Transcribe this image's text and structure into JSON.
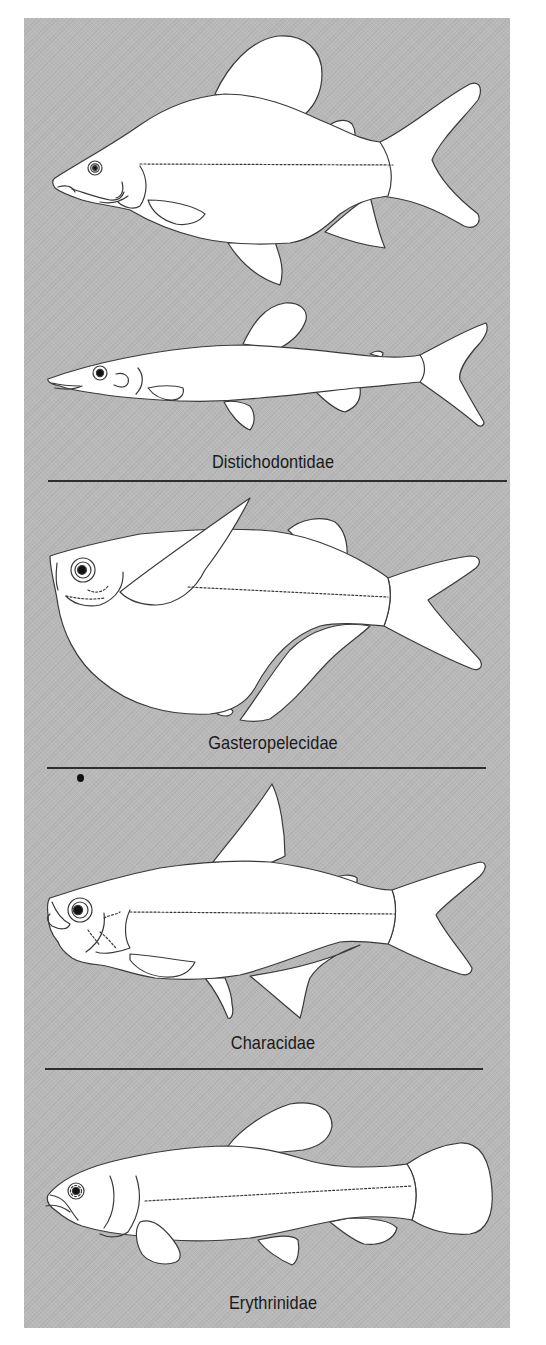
{
  "figure": {
    "background_color": "#b9b9b9",
    "outline_color": "#3a3a3a",
    "panels": [
      {
        "id": "distichodontidae",
        "label": "Distichodontidae",
        "fish_count": 2
      },
      {
        "id": "gasteropelecidae",
        "label": "Gasteropelecidae",
        "fish_count": 1
      },
      {
        "id": "characidae",
        "label": "Characidae",
        "fish_count": 1
      },
      {
        "id": "erythrinidae",
        "label": "Erythrinidae",
        "fish_count": 1
      }
    ],
    "dividers": 3
  }
}
